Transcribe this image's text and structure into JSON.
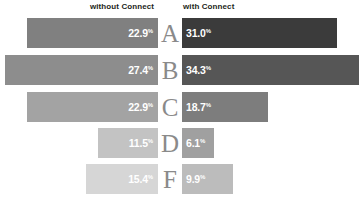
{
  "header": {
    "left_label": "without Connect",
    "right_label": "with Connect"
  },
  "chart_data": {
    "type": "bar",
    "title": "",
    "subtitle": "",
    "xlabel": "",
    "ylabel": "",
    "grid": false,
    "legend_position": "top",
    "orientation": "horizontal-diverging",
    "categories": [
      "A",
      "B",
      "C",
      "D",
      "F"
    ],
    "series": [
      {
        "name": "without Connect",
        "values": [
          22.9,
          27.4,
          22.9,
          11.5,
          15.4
        ],
        "labels": [
          "22.9%",
          "27.4%",
          "22.9%",
          "11.5%",
          "15.4%"
        ],
        "side": "left"
      },
      {
        "name": "with Connect",
        "values": [
          31.0,
          34.3,
          18.7,
          6.1,
          9.9
        ],
        "labels": [
          "31.0%",
          "34.3%",
          "18.7%",
          "6.1%",
          "9.9%"
        ],
        "side": "right"
      }
    ],
    "unit": "%",
    "xlim": [
      0,
      34.3
    ]
  },
  "rows": [
    {
      "letter": "A",
      "left": {
        "label": "22.9",
        "unit": "%",
        "color": "#808080",
        "width_px": 131,
        "text_color": "#ffffff"
      },
      "right": {
        "label": "31.0",
        "unit": "%",
        "color": "#3b3b3b",
        "width_px": 155,
        "text_color": "#ffffff"
      },
      "top_px": 18
    },
    {
      "letter": "B",
      "left": {
        "label": "27.4",
        "unit": "%",
        "color": "#8d8d8d",
        "width_px": 153,
        "text_color": "#ffffff"
      },
      "right": {
        "label": "34.3",
        "unit": "%",
        "color": "#565656",
        "width_px": 177,
        "text_color": "#ffffff"
      },
      "top_px": 55
    },
    {
      "letter": "C",
      "left": {
        "label": "22.9",
        "unit": "%",
        "color": "#a3a3a3",
        "width_px": 131,
        "text_color": "#ffffff"
      },
      "right": {
        "label": "18.7",
        "unit": "%",
        "color": "#7d7d7d",
        "width_px": 86,
        "text_color": "#ffffff"
      },
      "top_px": 92
    },
    {
      "letter": "D",
      "left": {
        "label": "11.5",
        "unit": "%",
        "color": "#c3c3c3",
        "width_px": 60,
        "text_color": "#ffffff"
      },
      "right": {
        "label": "6.1",
        "unit": "%",
        "color": "#a0a0a0",
        "width_px": 32,
        "text_color": "#ffffff"
      },
      "top_px": 128
    },
    {
      "letter": "F",
      "left": {
        "label": "15.4",
        "unit": "%",
        "color": "#d6d6d6",
        "width_px": 72,
        "text_color": "#ffffff"
      },
      "right": {
        "label": "9.9",
        "unit": "%",
        "color": "#bcbcbc",
        "width_px": 51,
        "text_color": "#ffffff"
      },
      "top_px": 164
    }
  ]
}
